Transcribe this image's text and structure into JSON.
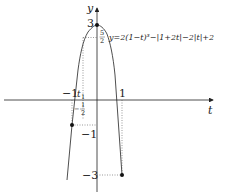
{
  "diagram": {
    "type": "function-graph",
    "axes": {
      "x_label": "t",
      "y_label": "y",
      "x_ticks": [
        "−1",
        "1"
      ],
      "y_ticks": [
        "3",
        "−1",
        "−3"
      ]
    },
    "equation": "y=2(1−t)³−|1+2t|−2|t|+2",
    "annotations": {
      "five_halves": {
        "num": "5",
        "den": "2"
      },
      "neg_half": {
        "sign": "−",
        "num": "1",
        "den": "2"
      },
      "t1": "t",
      "t1_sub": "1"
    },
    "points": [
      {
        "t": 0,
        "y": 3
      },
      {
        "t": -1,
        "y": -1
      },
      {
        "t": 1,
        "y": -3
      }
    ],
    "colors": {
      "line": "#222222",
      "dotted": "#555555"
    }
  }
}
